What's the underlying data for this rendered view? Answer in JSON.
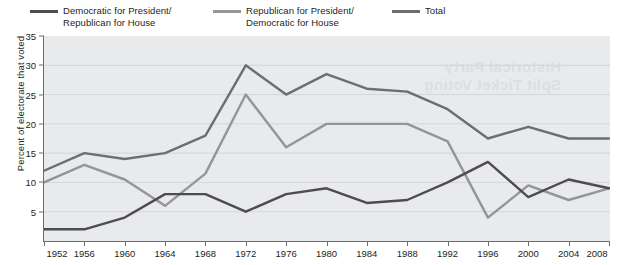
{
  "legend": {
    "items": [
      {
        "label": "Democratic for President/\nRepublican for House",
        "color": "#4d4d4f",
        "key": "dem_pres_rep_house"
      },
      {
        "label": "Republican for President/\nDemocratic for House",
        "color": "#939598",
        "key": "rep_pres_dem_house"
      },
      {
        "label": "Total",
        "color": "#6d6e71",
        "key": "total"
      }
    ]
  },
  "watermark": {
    "text": "Historical Party\nSplit Ticket Voting"
  },
  "chart_data": {
    "type": "line",
    "title": "",
    "xlabel": "",
    "ylabel": "Percent of electorate that voted",
    "categories": [
      1952,
      1956,
      1960,
      1964,
      1968,
      1972,
      1976,
      1980,
      1984,
      1988,
      1992,
      1996,
      2000,
      2004,
      2008
    ],
    "xtick_labels": [
      "1952",
      "1956",
      "1960",
      "1964",
      "1968",
      "1972",
      "1976",
      "1980",
      "1984",
      "1988",
      "1992",
      "1996",
      "2000",
      "2004",
      "2008"
    ],
    "ytick_labels": [
      "5",
      "10",
      "15",
      "20",
      "25",
      "30",
      "35"
    ],
    "yticks": [
      5,
      10,
      15,
      20,
      25,
      30,
      35
    ],
    "ylim": [
      0,
      35
    ],
    "xlim": [
      1952,
      2008
    ],
    "grid": true,
    "legend_position": "top",
    "series": [
      {
        "name": "Democratic for President/Republican for House",
        "color": "#4d4d4f",
        "values": [
          2,
          2,
          4,
          8,
          8,
          5,
          8,
          9,
          6.5,
          7,
          10,
          13.5,
          7.5,
          10.5,
          9
        ]
      },
      {
        "name": "Republican for President/Democratic for House",
        "color": "#939598",
        "values": [
          10,
          13,
          10.5,
          6,
          11.5,
          25,
          16,
          20,
          20,
          20,
          17,
          4,
          9.5,
          7,
          9
        ]
      },
      {
        "name": "Total",
        "color": "#6d6e71",
        "values": [
          12,
          15,
          14,
          15,
          18,
          30,
          25,
          28.5,
          26,
          25.5,
          22.5,
          17.5,
          19.5,
          17.5,
          17.5
        ]
      }
    ]
  }
}
